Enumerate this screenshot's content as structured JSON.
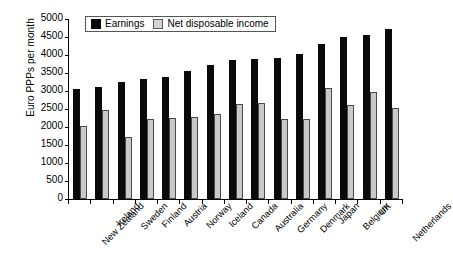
{
  "chart_data": {
    "type": "bar",
    "title": "",
    "xlabel": "",
    "ylabel": "Euro PPPs per month",
    "ylim": [
      0,
      5000
    ],
    "ytick_step": 500,
    "yticks": [
      "5000",
      "4500",
      "4000",
      "3500",
      "3000",
      "2500",
      "2000",
      "1500",
      "1000",
      "500",
      "0"
    ],
    "grid": false,
    "legend_position": "top-left-inside",
    "categories": [
      "New Zealand",
      "Ireland",
      "Sweden",
      "Finland",
      "Austria",
      "Norway",
      "Iceland",
      "Canada",
      "Australia",
      "Germany",
      "Denmark",
      "Japan",
      "Belgium",
      "UK",
      "Netherlands"
    ],
    "series": [
      {
        "name": "Earnings",
        "color": "#0a0a0a",
        "values": [
          3060,
          3100,
          3250,
          3340,
          3380,
          3560,
          3720,
          3860,
          3900,
          3920,
          4020,
          4310,
          4500,
          4560,
          4720
        ]
      },
      {
        "name": "Net disposable income",
        "color": "#c9c9c9",
        "values": [
          2030,
          2480,
          1730,
          2220,
          2240,
          2290,
          2350,
          2640,
          2680,
          2230,
          2220,
          3080,
          2600,
          2970,
          2530
        ]
      }
    ]
  }
}
